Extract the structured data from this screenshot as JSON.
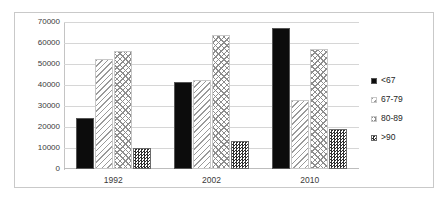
{
  "chart_data": {
    "type": "bar",
    "title": "",
    "subtitle": "",
    "xlabel": "",
    "ylabel": "",
    "categories": [
      "1992",
      "2002",
      "2010"
    ],
    "series": [
      {
        "name": "<67",
        "values": [
          24500,
          41500,
          67000
        ],
        "pattern": "solid-black",
        "color": "#0c0c0c"
      },
      {
        "name": "67-79",
        "values": [
          52500,
          42500,
          33000
        ],
        "pattern": "diagonal-hatch",
        "color": "#9a9a9a"
      },
      {
        "name": "80-89",
        "values": [
          56000,
          64000,
          57000
        ],
        "pattern": "diamond-cross-hatch",
        "color": "#8d8d8d"
      },
      {
        "name": ">90",
        "values": [
          10000,
          13500,
          19000
        ],
        "pattern": "dense-checkerboard",
        "color": "#2e2e2e"
      }
    ],
    "ylim": [
      0,
      70000
    ],
    "ytick_step": 10000,
    "yticks": [
      0,
      10000,
      20000,
      30000,
      40000,
      50000,
      60000,
      70000
    ],
    "ytick_labels": [
      "0",
      "10000",
      "20000",
      "30000",
      "40000",
      "50000",
      "60000",
      "70000"
    ],
    "grid": true,
    "grid_axis": "y",
    "legend_position": "right",
    "legend_entries": [
      "<67",
      "67-79",
      "80-89",
      ">90"
    ],
    "border": true,
    "background_color": "#ffffff"
  }
}
